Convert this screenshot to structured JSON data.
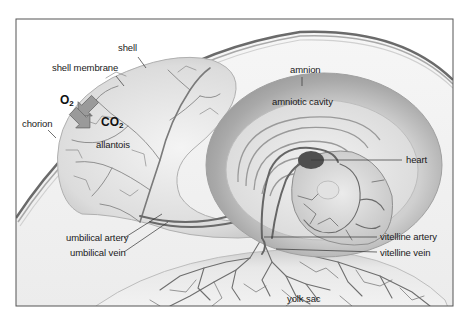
{
  "labels": {
    "shell": "shell",
    "shell_membrane": "shell membrane",
    "chorion": "chorion",
    "allantois": "allantois",
    "amnion": "amnion",
    "amniotic_cavity": "amniotic cavity",
    "heart": "heart",
    "umbilical_artery": "umbilical artery",
    "umbilical_vein": "umbilical vein",
    "vitelline_artery": "vitelline artery",
    "vitelline_vein": "vitelline vein",
    "yolk_sac": "yolk sac"
  },
  "gas_exchange": {
    "in": {
      "symbol": "O",
      "subscript": "2"
    },
    "out": {
      "symbol": "CO",
      "subscript": "2"
    }
  },
  "colors": {
    "frame": "#555555",
    "background": "#ffffff",
    "albumen": "#f2f2f2",
    "membrane": "#bdbdbd",
    "vessel": "#6e6e6e",
    "heart": "#4a4a4a",
    "amnion_ring": "#a8a8a8",
    "text": "#1a1a1a"
  }
}
